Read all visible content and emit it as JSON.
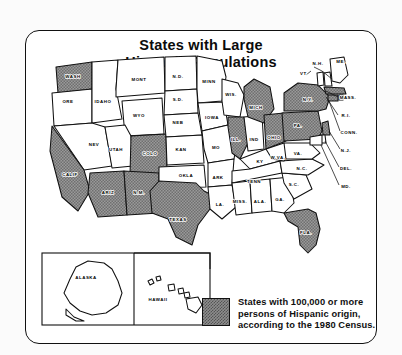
{
  "title": {
    "line1": "States with Large",
    "line2": "Hispanic Populations"
  },
  "legend": {
    "swatch_icon": "gray-shaded-swatch",
    "swatch_color": "#8d8d8d",
    "line1": "States with 100,000 or more",
    "line2": "persons of Hispanic origin,",
    "line3": "according to the 1980 Census."
  },
  "map_data": {
    "type": "choropleth",
    "highlight_color": "#8d8d8d",
    "plain_color": "#ffffff",
    "criterion": "100,000 or more persons of Hispanic origin (1980 Census)",
    "highlighted_states": [
      "WASH",
      "CALIF",
      "ARIZ",
      "COLO",
      "N.M.",
      "TEXAS",
      "ILL.",
      "MICH",
      "OHIO",
      "PA.",
      "N.Y.",
      "MASS.",
      "CONN.",
      "N.J.",
      "FLA."
    ],
    "plain_states": [
      "ORE",
      "IDAHO",
      "MONT",
      "NEV",
      "UTAH",
      "WYO",
      "N.D.",
      "S.D.",
      "NEB",
      "KAN",
      "OKLA",
      "MINN",
      "IOWA",
      "MO",
      "ARK",
      "LA.",
      "WIS.",
      "IND",
      "KY",
      "TENN",
      "MISS.",
      "ALA.",
      "GA.",
      "S.C.",
      "N.C.",
      "VA.",
      "W.VA.",
      "ME.",
      "N.H.",
      "VT.",
      "R.I.",
      "DEL.",
      "MD.",
      "ALASKA",
      "HAWAII"
    ],
    "labels": [
      {
        "id": "wash",
        "text": "WASH",
        "x": 47,
        "y": 47,
        "highlighted": true
      },
      {
        "id": "ore",
        "text": "ORE",
        "x": 42,
        "y": 72,
        "highlighted": false
      },
      {
        "id": "calif",
        "text": "CALIF",
        "x": 44,
        "y": 145,
        "highlighted": true
      },
      {
        "id": "nev",
        "text": "NEV",
        "x": 68,
        "y": 115,
        "highlighted": false
      },
      {
        "id": "idaho",
        "text": "IDAHO",
        "x": 77,
        "y": 72,
        "highlighted": false
      },
      {
        "id": "mont",
        "text": "MONT",
        "x": 113,
        "y": 50,
        "highlighted": false
      },
      {
        "id": "wyo",
        "text": "WYO",
        "x": 113,
        "y": 86,
        "highlighted": false
      },
      {
        "id": "utah",
        "text": "UTAH",
        "x": 90,
        "y": 120,
        "highlighted": false
      },
      {
        "id": "ariz",
        "text": "ARIZ",
        "x": 82,
        "y": 163,
        "highlighted": true
      },
      {
        "id": "nm",
        "text": "N.M.",
        "x": 113,
        "y": 163,
        "highlighted": true
      },
      {
        "id": "colo",
        "text": "COLO",
        "x": 124,
        "y": 124,
        "highlighted": true
      },
      {
        "id": "nd",
        "text": "N.D.",
        "x": 152,
        "y": 47,
        "highlighted": false
      },
      {
        "id": "sd",
        "text": "S.D.",
        "x": 152,
        "y": 70,
        "highlighted": false
      },
      {
        "id": "neb",
        "text": "NEB",
        "x": 152,
        "y": 93,
        "highlighted": false
      },
      {
        "id": "kan",
        "text": "KAN",
        "x": 155,
        "y": 120,
        "highlighted": false
      },
      {
        "id": "okla",
        "text": "OKLA",
        "x": 160,
        "y": 146,
        "highlighted": false
      },
      {
        "id": "texas",
        "text": "TEXAS",
        "x": 152,
        "y": 190,
        "highlighted": true
      },
      {
        "id": "minn",
        "text": "MINN",
        "x": 183,
        "y": 52,
        "highlighted": false
      },
      {
        "id": "iowa",
        "text": "IOWA",
        "x": 186,
        "y": 88,
        "highlighted": false
      },
      {
        "id": "mo",
        "text": "MO",
        "x": 190,
        "y": 118,
        "highlighted": false
      },
      {
        "id": "ark",
        "text": "ARK",
        "x": 192,
        "y": 148,
        "highlighted": false
      },
      {
        "id": "la",
        "text": "LA.",
        "x": 194,
        "y": 175,
        "highlighted": false
      },
      {
        "id": "wis",
        "text": "WIS.",
        "x": 205,
        "y": 65,
        "highlighted": false
      },
      {
        "id": "ill",
        "text": "ILL.",
        "x": 210,
        "y": 110,
        "highlighted": true
      },
      {
        "id": "ind",
        "text": "IND",
        "x": 228,
        "y": 110,
        "highlighted": false
      },
      {
        "id": "mich",
        "text": "MICH",
        "x": 230,
        "y": 78,
        "highlighted": true
      },
      {
        "id": "ohio",
        "text": "OHIO",
        "x": 248,
        "y": 108,
        "highlighted": true
      },
      {
        "id": "ky",
        "text": "KY",
        "x": 234,
        "y": 132,
        "highlighted": false
      },
      {
        "id": "tenn",
        "text": "TENN",
        "x": 228,
        "y": 152,
        "highlighted": false
      },
      {
        "id": "miss",
        "text": "MISS.",
        "x": 214,
        "y": 172,
        "highlighted": false
      },
      {
        "id": "ala",
        "text": "ALA.",
        "x": 234,
        "y": 172,
        "highlighted": false
      },
      {
        "id": "ga",
        "text": "GA.",
        "x": 254,
        "y": 170,
        "highlighted": false
      },
      {
        "id": "sc",
        "text": "S.C.",
        "x": 268,
        "y": 155,
        "highlighted": false
      },
      {
        "id": "nc",
        "text": "N.C.",
        "x": 276,
        "y": 139,
        "highlighted": false
      },
      {
        "id": "wva",
        "text": "W.VA.",
        "x": 252,
        "y": 128,
        "highlighted": false
      },
      {
        "id": "va",
        "text": "VA.",
        "x": 272,
        "y": 124,
        "highlighted": false
      },
      {
        "id": "pa",
        "text": "PA.",
        "x": 272,
        "y": 96,
        "highlighted": true
      },
      {
        "id": "ny",
        "text": "N.Y.",
        "x": 282,
        "y": 70,
        "highlighted": true
      },
      {
        "id": "fla",
        "text": "FLA.",
        "x": 280,
        "y": 203,
        "highlighted": true
      },
      {
        "id": "nh",
        "text": "N.H.",
        "x": 292,
        "y": 34,
        "highlighted": false
      },
      {
        "id": "me",
        "text": "ME.",
        "x": 315,
        "y": 32,
        "highlighted": false
      },
      {
        "id": "vt",
        "text": "VT.",
        "x": 278,
        "y": 44,
        "highlighted": false
      },
      {
        "id": "mass",
        "text": "MASS.",
        "x": 322,
        "y": 68,
        "highlighted": false
      },
      {
        "id": "ri",
        "text": "R.I.",
        "x": 320,
        "y": 86,
        "highlighted": false
      },
      {
        "id": "conn",
        "text": "CONN.",
        "x": 323,
        "y": 103,
        "highlighted": false
      },
      {
        "id": "nj",
        "text": "N.J.",
        "x": 320,
        "y": 121,
        "highlighted": false
      },
      {
        "id": "del",
        "text": "DEL.",
        "x": 320,
        "y": 139,
        "highlighted": false
      },
      {
        "id": "md",
        "text": "MD.",
        "x": 320,
        "y": 157,
        "highlighted": false
      },
      {
        "id": "alaska",
        "text": "ALASKA",
        "x": 60,
        "y": 248,
        "highlighted": false
      },
      {
        "id": "hawaii",
        "text": "HAWAII",
        "x": 132,
        "y": 270,
        "highlighted": false
      }
    ]
  }
}
